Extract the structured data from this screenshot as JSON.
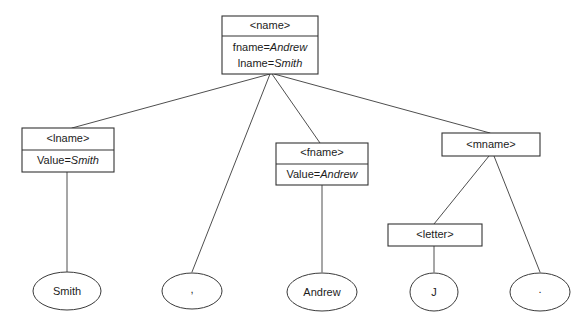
{
  "diagram": {
    "type": "xml-parse-tree",
    "background_color": "#ffffff",
    "line_color": "#3a3a3a",
    "box_stroke_color": "#333333",
    "text_color": "#1c1c1c"
  },
  "nodes": {
    "name": {
      "tag": "<name>",
      "attributes": [
        {
          "key": "fname=",
          "value": "Andrew"
        },
        {
          "key": "lname=",
          "value": "Smith"
        }
      ]
    },
    "lname": {
      "tag": "<lname>",
      "attributes": [
        {
          "key": "Value=",
          "value": "Smith"
        }
      ]
    },
    "fname": {
      "tag": "<fname>",
      "attributes": [
        {
          "key": "Value=",
          "value": "Andrew"
        }
      ]
    },
    "mname": {
      "tag": "<mname>",
      "attributes": []
    },
    "letter": {
      "tag": "<letter>",
      "attributes": []
    }
  },
  "leaves": {
    "smith": {
      "label": "Smith"
    },
    "comma": {
      "label": ","
    },
    "andrew": {
      "label": "Andrew"
    },
    "j": {
      "label": "J"
    },
    "period": {
      "label": "."
    }
  },
  "edges": [
    {
      "from": "name",
      "to": "lname"
    },
    {
      "from": "name",
      "to": "comma"
    },
    {
      "from": "name",
      "to": "fname"
    },
    {
      "from": "name",
      "to": "mname"
    },
    {
      "from": "lname",
      "to": "smith"
    },
    {
      "from": "fname",
      "to": "andrew"
    },
    {
      "from": "mname",
      "to": "letter"
    },
    {
      "from": "mname",
      "to": "period"
    },
    {
      "from": "letter",
      "to": "j"
    }
  ]
}
